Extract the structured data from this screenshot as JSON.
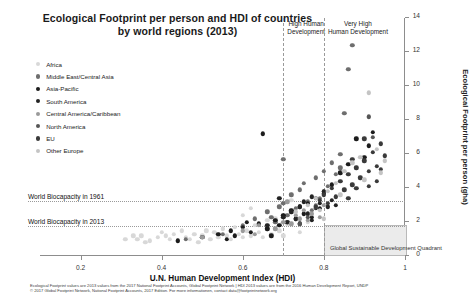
{
  "chart_data": {
    "type": "scatter",
    "title": "Ecological Footprint per person and HDI of countries by world regions (2013)",
    "title_line1": "Ecological Footprint per person and HDI of countries",
    "title_line2": "by world regions (2013)",
    "xlabel": "U.N. Human Development Index (HDI)",
    "ylabel": "Ecological Footprint per person (gha)",
    "xlim": [
      0.1,
      1.0
    ],
    "ylim": [
      0,
      14
    ],
    "xticks": [
      "0.2",
      "0.4",
      "0.6",
      "0.8",
      "1"
    ],
    "xtick_values": [
      0.2,
      0.4,
      0.6,
      0.8,
      1.0
    ],
    "yticks": [
      "0",
      "2",
      "4",
      "6",
      "8",
      "10",
      "12",
      "14"
    ],
    "ytick_values": [
      0,
      2,
      4,
      6,
      8,
      10,
      12,
      14
    ],
    "grid": false,
    "legend_position": "upper-left-inside",
    "annotations": [
      {
        "name": "high-human-development",
        "text": "High Human\nDevelopment",
        "line1": "High Human",
        "line2": "Development",
        "x": 0.7
      },
      {
        "name": "very-high-human-development",
        "text": "Very High\nHuman Development",
        "line1": "Very High",
        "line2": "Human Development",
        "x": 0.8
      },
      {
        "name": "world-biocapacity-1961",
        "text": "World Biocapacity in 1961",
        "y": 3.2
      },
      {
        "name": "world-biocapacity-2013",
        "text": "World Biocapacity in 2013",
        "y": 1.7
      },
      {
        "name": "global-sustainable-development-quadrant",
        "text": "Global Sustainable Development Quadrant",
        "x_range": [
          0.8,
          1.0
        ],
        "y_range": [
          0,
          1.7
        ]
      }
    ],
    "series": [
      {
        "name": "Africa",
        "color": "#d8d8d8",
        "points": [
          [
            0.34,
            1.0
          ],
          [
            0.35,
            1.2
          ],
          [
            0.37,
            0.9
          ],
          [
            0.39,
            1.1
          ],
          [
            0.4,
            1.4
          ],
          [
            0.42,
            1.0
          ],
          [
            0.43,
            1.3
          ],
          [
            0.44,
            0.9
          ],
          [
            0.45,
            1.5
          ],
          [
            0.46,
            1.1
          ],
          [
            0.47,
            1.0
          ],
          [
            0.48,
            1.3
          ],
          [
            0.49,
            0.8
          ],
          [
            0.5,
            1.2
          ],
          [
            0.51,
            1.5
          ],
          [
            0.52,
            1.0
          ],
          [
            0.53,
            1.4
          ],
          [
            0.54,
            1.1
          ],
          [
            0.55,
            1.6
          ],
          [
            0.56,
            1.2
          ],
          [
            0.57,
            1.0
          ],
          [
            0.58,
            1.7
          ],
          [
            0.59,
            1.3
          ],
          [
            0.6,
            1.1
          ],
          [
            0.61,
            1.5
          ],
          [
            0.62,
            1.2
          ],
          [
            0.63,
            1.8
          ],
          [
            0.64,
            1.4
          ],
          [
            0.65,
            1.1
          ],
          [
            0.66,
            1.6
          ],
          [
            0.67,
            1.3
          ],
          [
            0.68,
            2.2
          ],
          [
            0.69,
            1.5
          ],
          [
            0.7,
            1.2
          ],
          [
            0.71,
            1.9
          ],
          [
            0.72,
            3.3
          ],
          [
            0.74,
            1.4
          ],
          [
            0.76,
            2.0
          ],
          [
            0.31,
            1.0
          ],
          [
            0.33,
            1.2
          ],
          [
            0.36,
            0.8
          ],
          [
            0.41,
            1.2
          ],
          [
            0.6,
            2.4
          ],
          [
            0.62,
            2.8
          ],
          [
            0.66,
            2.1
          ]
        ]
      },
      {
        "name": "Middle East/Central Asia",
        "color": "#6e6e6e",
        "points": [
          [
            0.46,
            1.0
          ],
          [
            0.55,
            1.3
          ],
          [
            0.6,
            1.8
          ],
          [
            0.63,
            2.2
          ],
          [
            0.66,
            2.6
          ],
          [
            0.68,
            2.0
          ],
          [
            0.69,
            2.9
          ],
          [
            0.7,
            3.1
          ],
          [
            0.71,
            2.4
          ],
          [
            0.72,
            3.6
          ],
          [
            0.73,
            2.8
          ],
          [
            0.74,
            3.9
          ],
          [
            0.75,
            4.3
          ],
          [
            0.76,
            3.2
          ],
          [
            0.77,
            2.7
          ],
          [
            0.78,
            4.6
          ],
          [
            0.79,
            3.4
          ],
          [
            0.8,
            5.0
          ],
          [
            0.81,
            4.1
          ],
          [
            0.82,
            5.5
          ],
          [
            0.83,
            4.8
          ],
          [
            0.84,
            6.0
          ],
          [
            0.85,
            8.4
          ],
          [
            0.86,
            11.0
          ],
          [
            0.87,
            12.4
          ],
          [
            0.84,
            5.2
          ],
          [
            0.8,
            3.8
          ],
          [
            0.78,
            3.0
          ],
          [
            0.67,
            2.3
          ],
          [
            0.7,
            5.7
          ]
        ]
      },
      {
        "name": "Asia-Pacific",
        "color": "#1c1c1c",
        "points": [
          [
            0.44,
            0.9
          ],
          [
            0.5,
            1.1
          ],
          [
            0.54,
            1.3
          ],
          [
            0.57,
            1.5
          ],
          [
            0.58,
            1.2
          ],
          [
            0.6,
            1.7
          ],
          [
            0.62,
            1.4
          ],
          [
            0.64,
            1.9
          ],
          [
            0.66,
            1.6
          ],
          [
            0.68,
            2.1
          ],
          [
            0.69,
            1.8
          ],
          [
            0.7,
            2.4
          ],
          [
            0.71,
            2.0
          ],
          [
            0.72,
            2.7
          ],
          [
            0.73,
            2.2
          ],
          [
            0.74,
            2.9
          ],
          [
            0.75,
            2.5
          ],
          [
            0.76,
            3.1
          ],
          [
            0.77,
            2.3
          ],
          [
            0.78,
            3.4
          ],
          [
            0.79,
            2.8
          ],
          [
            0.8,
            3.7
          ],
          [
            0.82,
            4.2
          ],
          [
            0.84,
            4.9
          ],
          [
            0.86,
            5.4
          ],
          [
            0.88,
            6.9
          ],
          [
            0.9,
            5.8
          ],
          [
            0.91,
            6.5
          ],
          [
            0.92,
            7.3
          ],
          [
            0.56,
            1.0
          ],
          [
            0.61,
            2.0
          ],
          [
            0.65,
            7.2
          ],
          [
            0.67,
            1.2
          ]
        ]
      },
      {
        "name": "South America",
        "color": "#232323",
        "points": [
          [
            0.66,
            1.8
          ],
          [
            0.7,
            2.3
          ],
          [
            0.71,
            2.0
          ],
          [
            0.72,
            2.6
          ],
          [
            0.73,
            2.2
          ],
          [
            0.74,
            2.9
          ],
          [
            0.75,
            3.2
          ],
          [
            0.76,
            2.5
          ],
          [
            0.77,
            3.5
          ],
          [
            0.78,
            2.8
          ],
          [
            0.79,
            3.1
          ],
          [
            0.8,
            3.8
          ],
          [
            0.81,
            2.9
          ],
          [
            0.82,
            3.3
          ],
          [
            0.83,
            3.0
          ],
          [
            0.69,
            3.4
          ],
          [
            0.74,
            1.9
          ],
          [
            0.77,
            2.1
          ]
        ]
      },
      {
        "name": "Central America/Caribbean",
        "color": "#9a9a9a",
        "points": [
          [
            0.5,
            1.1
          ],
          [
            0.6,
            1.5
          ],
          [
            0.64,
            1.8
          ],
          [
            0.68,
            1.6
          ],
          [
            0.7,
            2.0
          ],
          [
            0.72,
            1.9
          ],
          [
            0.73,
            2.4
          ],
          [
            0.74,
            2.2
          ],
          [
            0.75,
            2.7
          ],
          [
            0.76,
            2.1
          ],
          [
            0.77,
            2.5
          ],
          [
            0.78,
            2.9
          ],
          [
            0.79,
            2.3
          ],
          [
            0.8,
            3.0
          ],
          [
            0.63,
            1.3
          ],
          [
            0.71,
            3.2
          ]
        ]
      },
      {
        "name": "North America",
        "color": "#555555",
        "points": [
          [
            0.74,
            1.9
          ],
          [
            0.91,
            8.2
          ],
          [
            0.92,
            7.0
          ],
          [
            0.76,
            2.3
          ]
        ]
      },
      {
        "name": "EU",
        "color": "#3a3a3a",
        "points": [
          [
            0.78,
            2.9
          ],
          [
            0.79,
            3.3
          ],
          [
            0.8,
            3.6
          ],
          [
            0.81,
            3.1
          ],
          [
            0.82,
            4.0
          ],
          [
            0.83,
            3.5
          ],
          [
            0.84,
            4.4
          ],
          [
            0.85,
            3.9
          ],
          [
            0.86,
            4.8
          ],
          [
            0.87,
            4.2
          ],
          [
            0.88,
            5.2
          ],
          [
            0.89,
            4.6
          ],
          [
            0.9,
            5.6
          ],
          [
            0.91,
            5.0
          ],
          [
            0.92,
            6.1
          ],
          [
            0.93,
            5.3
          ],
          [
            0.94,
            6.6
          ],
          [
            0.95,
            5.9
          ],
          [
            0.86,
            3.4
          ],
          [
            0.88,
            4.0
          ],
          [
            0.9,
            6.9
          ],
          [
            0.93,
            4.4
          ],
          [
            0.91,
            4.1
          ],
          [
            0.94,
            5.1
          ],
          [
            0.87,
            5.7
          ]
        ]
      },
      {
        "name": "Other Europe",
        "color": "#c4c4c4",
        "points": [
          [
            0.73,
            2.6
          ],
          [
            0.76,
            3.0
          ],
          [
            0.78,
            3.4
          ],
          [
            0.79,
            2.7
          ],
          [
            0.81,
            3.8
          ],
          [
            0.83,
            4.3
          ],
          [
            0.85,
            5.0
          ],
          [
            0.87,
            5.5
          ],
          [
            0.89,
            5.8
          ],
          [
            0.91,
            9.6
          ],
          [
            0.93,
            6.3
          ],
          [
            0.95,
            5.6
          ],
          [
            0.94,
            4.9
          ],
          [
            0.8,
            2.2
          ],
          [
            0.84,
            3.6
          ],
          [
            0.9,
            4.5
          ]
        ]
      }
    ]
  },
  "footnote": {
    "line1": "Ecological Footprint values are 2013 values from the 2017 National Footprint Accounts, Global Footprint Network   |   HDI 2013 values are from the 2016 Human Development Report, UNDP",
    "line2": "© 2017 Global Footprint Network, National Footprint Accounts, 2017 Edition. For more informationen, contact data@footprintnetwork.org"
  }
}
